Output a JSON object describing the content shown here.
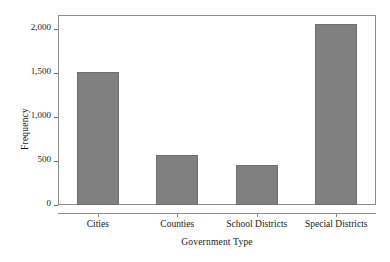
{
  "chart_data": {
    "type": "bar",
    "title": "",
    "subtitle": "",
    "xlabel": "Government Type",
    "ylabel": "Frequency",
    "categories": [
      "Cities",
      "Counties",
      "School Districts",
      "Special Districts"
    ],
    "values": [
      1510,
      570,
      460,
      2060
    ],
    "series": [
      {
        "name": "Frequency",
        "values": [
          1510,
          570,
          460,
          2060
        ]
      }
    ],
    "ylim": [
      0,
      2160
    ],
    "yticks": [
      0,
      500,
      1000,
      1500,
      2000
    ],
    "ytick_labels": [
      "0",
      "500",
      "1,000",
      "1,500",
      "2,000"
    ],
    "grid": false,
    "legend": false,
    "legend_position": "none",
    "bar_color": "#808080",
    "bar_edge_color": "#6f6f6f",
    "frame_color": "#8e8e8e",
    "background": "#ffffff",
    "annotations": []
  }
}
